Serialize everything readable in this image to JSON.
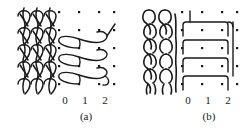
{
  "figure": {
    "caption_a": "(a)",
    "caption_b": "(b)",
    "stroke_color": "#1a1a1a",
    "dot_color": "#1a1a1a",
    "background_color": "#ffffff"
  },
  "panels": [
    {
      "id": "a",
      "caption": "(a)",
      "swatch_name": "knitted-fabric-plain-stitch",
      "notation_name": "loop-diagram-crossed",
      "axis_ticks": [
        "0",
        "1",
        "2"
      ],
      "grid": {
        "columns": 4,
        "rows": 5,
        "col_spacing": 20,
        "row_spacing": 18
      },
      "stitch_rows": 3,
      "stitch_style": "crossed-s-loop"
    },
    {
      "id": "b",
      "caption": "(b)",
      "swatch_name": "knitted-fabric-tuck-stitch",
      "notation_name": "loop-diagram-squared",
      "axis_ticks": [
        "0",
        "1",
        "2"
      ],
      "grid": {
        "columns": 4,
        "rows": 5,
        "col_spacing": 20,
        "row_spacing": 18
      },
      "stitch_rows": 4,
      "stitch_style": "rectangular-loop"
    }
  ]
}
